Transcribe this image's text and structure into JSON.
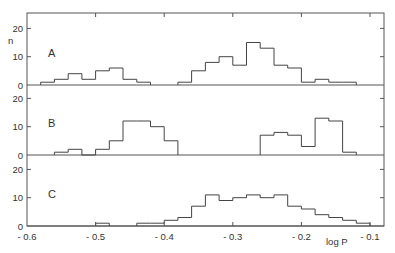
{
  "chart_data": {
    "type": "bar",
    "subtype": "histogram-stacked-panels",
    "xlabel": "log P",
    "ylabel": "n",
    "xlim": [
      -0.6,
      -0.08
    ],
    "x_ticks": [
      -0.6,
      -0.5,
      -0.4,
      -0.3,
      -0.2,
      -0.1
    ],
    "x_tick_labels": [
      "- 0.6",
      "- 0.5",
      "- 0.4",
      "- 0.3",
      "- 0.2",
      "- 0.1"
    ],
    "bin_width": 0.02,
    "grid": false,
    "legend": null,
    "panels": [
      {
        "name": "A",
        "ylim": [
          0,
          25
        ],
        "y_ticks": [
          0,
          10,
          20
        ],
        "bins": [
          {
            "x0": -0.58,
            "n": 1
          },
          {
            "x0": -0.56,
            "n": 2
          },
          {
            "x0": -0.54,
            "n": 4
          },
          {
            "x0": -0.52,
            "n": 2
          },
          {
            "x0": -0.5,
            "n": 5
          },
          {
            "x0": -0.48,
            "n": 6
          },
          {
            "x0": -0.46,
            "n": 2
          },
          {
            "x0": -0.44,
            "n": 1
          },
          {
            "x0": -0.38,
            "n": 1
          },
          {
            "x0": -0.36,
            "n": 5
          },
          {
            "x0": -0.34,
            "n": 8
          },
          {
            "x0": -0.32,
            "n": 10
          },
          {
            "x0": -0.3,
            "n": 7
          },
          {
            "x0": -0.28,
            "n": 15
          },
          {
            "x0": -0.26,
            "n": 13
          },
          {
            "x0": -0.24,
            "n": 7
          },
          {
            "x0": -0.22,
            "n": 6
          },
          {
            "x0": -0.2,
            "n": 1
          },
          {
            "x0": -0.18,
            "n": 2
          },
          {
            "x0": -0.16,
            "n": 1
          },
          {
            "x0": -0.14,
            "n": 1
          }
        ]
      },
      {
        "name": "B",
        "ylim": [
          0,
          25
        ],
        "y_ticks": [
          0,
          10,
          20
        ],
        "bins": [
          {
            "x0": -0.56,
            "n": 1
          },
          {
            "x0": -0.54,
            "n": 2
          },
          {
            "x0": -0.52,
            "n": 0
          },
          {
            "x0": -0.5,
            "n": 2
          },
          {
            "x0": -0.48,
            "n": 5
          },
          {
            "x0": -0.46,
            "n": 12
          },
          {
            "x0": -0.44,
            "n": 12
          },
          {
            "x0": -0.42,
            "n": 10
          },
          {
            "x0": -0.4,
            "n": 5
          },
          {
            "x0": -0.26,
            "n": 7
          },
          {
            "x0": -0.24,
            "n": 8
          },
          {
            "x0": -0.22,
            "n": 7
          },
          {
            "x0": -0.2,
            "n": 3
          },
          {
            "x0": -0.18,
            "n": 13
          },
          {
            "x0": -0.16,
            "n": 12
          },
          {
            "x0": -0.14,
            "n": 1
          }
        ]
      },
      {
        "name": "C",
        "ylim": [
          0,
          25
        ],
        "y_ticks": [
          0,
          10,
          20
        ],
        "bins": [
          {
            "x0": -0.5,
            "n": 1
          },
          {
            "x0": -0.44,
            "n": 1
          },
          {
            "x0": -0.42,
            "n": 1
          },
          {
            "x0": -0.4,
            "n": 2
          },
          {
            "x0": -0.38,
            "n": 3
          },
          {
            "x0": -0.36,
            "n": 7
          },
          {
            "x0": -0.34,
            "n": 11
          },
          {
            "x0": -0.32,
            "n": 9
          },
          {
            "x0": -0.3,
            "n": 10
          },
          {
            "x0": -0.28,
            "n": 11
          },
          {
            "x0": -0.26,
            "n": 10
          },
          {
            "x0": -0.24,
            "n": 11
          },
          {
            "x0": -0.22,
            "n": 7
          },
          {
            "x0": -0.2,
            "n": 6
          },
          {
            "x0": -0.18,
            "n": 4
          },
          {
            "x0": -0.16,
            "n": 3
          },
          {
            "x0": -0.14,
            "n": 2
          },
          {
            "x0": -0.12,
            "n": 1
          }
        ]
      }
    ]
  },
  "labels": {
    "ylabel": "n",
    "xlabel": "log P",
    "panel_a": "A",
    "panel_b": "B",
    "panel_c": "C",
    "y_tick_0": "0",
    "y_tick_10": "10",
    "y_tick_20": "20"
  }
}
